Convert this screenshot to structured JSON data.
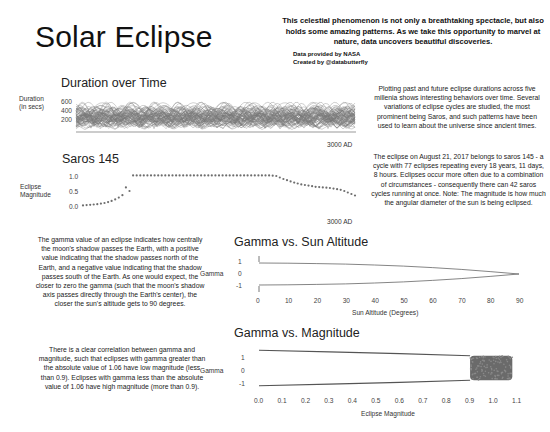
{
  "header": {
    "title": "Solar Eclipse",
    "intro": "This celestial phenomenon is not only a breathtaking spectacle, but also holds some amazing patterns. As we take this opportunity to marvel at nature, data uncovers beautiful discoveries.",
    "credit_data": "Data provided by NASA",
    "credit_creator": "Created by @databutterfly"
  },
  "sections": {
    "duration": {
      "title": "Duration over Time",
      "ylabel_line1": "Duration",
      "ylabel_line2": "(in secs)",
      "yticks": [
        "600",
        "400",
        "200"
      ],
      "end_label": "3000 AD",
      "description": "Plotting past and future eclipse durations across five millenia shows interesting behaviors over time. Several variations of eclipse cycles are studied, the most prominent being Saros, and such patterns have been used to learn about the universe since ancient times."
    },
    "saros": {
      "title": "Saros 145",
      "ylabel_line1": "Eclipse",
      "ylabel_line2": "Magnitude",
      "yticks": [
        "1.0",
        "0.5",
        "0.0"
      ],
      "end_label": "3000 AD",
      "description": "The eclipse on August 21, 2017 belongs to saros 145 - a cycle with 77 eclipses repeating every 18 years, 11 days, 8 hours. Eclipses occur more often due to a combination of circumstances - consequently there can 42 saros cycles running at once.  Note: The magnitude is how much the angular diameter of the sun is being eclipsed."
    },
    "gamma_altitude": {
      "title": "Gamma vs. Sun Altitude",
      "ylabel": "Gamma",
      "yticks": [
        "1",
        "0",
        "-1"
      ],
      "xticks": [
        "0",
        "10",
        "20",
        "30",
        "40",
        "50",
        "60",
        "70",
        "80",
        "90"
      ],
      "xlabel": "Sun Altitude (Degrees)",
      "description": "The gamma value of an eclipse indicates how centrally the moon's shadow passes the Earth, with a positive value indicating that the shadow passes north of the Earth, and a negative value indicating that the shadow passes south of the Earth. As one would expect, the closer to zero the gamma (such that the moon's shadow axis passes directly through the Earth's center), the closer the sun's altitude gets to 90 degrees."
    },
    "gamma_magnitude": {
      "title": "Gamma vs. Magnitude",
      "ylabel": "Gamma",
      "yticks": [
        "1",
        "0",
        "-1"
      ],
      "xticks": [
        "0.0",
        "0.1",
        "0.2",
        "0.3",
        "0.4",
        "0.5",
        "0.6",
        "0.7",
        "0.8",
        "0.9",
        "1.0",
        "1.1"
      ],
      "xlabel": "Eclipse Magnitude",
      "description": "There is a clear correlation between gamma and magnitude, such that eclipses with gamma greater than the absolute value of 1.06 have low magnitude (less than 0.9). Eclipses with gamma less than the absolute value of 1.06 have high magnitude (more than 0.9)."
    }
  },
  "colors": {
    "ink": "#111111",
    "series": "#777777",
    "dots": "#6e6e6e"
  },
  "chart_data": [
    {
      "type": "line",
      "title": "Duration over Time",
      "xlabel": "",
      "ylabel": "Duration (in secs)",
      "yticks": [
        200,
        400,
        600
      ],
      "ylim": [
        0,
        700
      ],
      "x_end_label": "3000 AD",
      "grid": false,
      "legend": "none",
      "note": "Many overlapping saros-cycle arcs spanning five millennia; durations mostly 0-450 s with peaks up to ~650 s."
    },
    {
      "type": "scatter",
      "title": "Saros 145",
      "ylabel": "Eclipse Magnitude",
      "yticks": [
        0.0,
        0.5,
        1.0
      ],
      "ylim": [
        0,
        1.1
      ],
      "x_end_label": "3000 AD",
      "series": [
        {
          "name": "Saros 145 eclipses",
          "count": 77,
          "values": [
            0.02,
            0.03,
            0.04,
            0.05,
            0.06,
            0.08,
            0.1,
            0.13,
            0.17,
            0.22,
            0.28,
            0.36,
            0.62,
            0.5,
            1.02,
            1.02,
            1.02,
            1.02,
            1.02,
            1.02,
            1.02,
            1.02,
            1.02,
            1.02,
            1.02,
            1.02,
            1.02,
            1.02,
            1.02,
            1.02,
            1.02,
            1.02,
            1.02,
            1.02,
            1.02,
            1.02,
            1.02,
            1.02,
            1.02,
            1.02,
            1.02,
            1.02,
            1.02,
            1.02,
            1.02,
            1.02,
            1.02,
            1.02,
            1.02,
            1.02,
            1.02,
            1.02,
            1.02,
            1.01,
            1.0,
            0.95,
            0.9,
            0.86,
            0.82,
            0.78,
            0.75,
            0.72,
            0.7,
            0.68,
            0.66,
            0.64,
            0.63,
            0.62,
            0.61,
            0.6,
            0.58,
            0.56,
            0.54,
            0.5,
            0.45,
            0.4,
            0.35
          ]
        }
      ]
    },
    {
      "type": "scatter",
      "title": "Gamma vs. Sun Altitude",
      "xlabel": "Sun Altitude (Degrees)",
      "ylabel": "Gamma",
      "xticks": [
        0,
        10,
        20,
        30,
        40,
        50,
        60,
        70,
        80,
        90
      ],
      "yticks": [
        -1,
        0,
        1
      ],
      "xlim": [
        0,
        90
      ],
      "ylim": [
        -1.6,
        1.6
      ],
      "series": [
        {
          "name": "upper branch",
          "x": [
            0,
            10,
            20,
            30,
            40,
            50,
            60,
            70,
            80,
            90
          ],
          "y": [
            1.0,
            0.98,
            0.95,
            0.9,
            0.82,
            0.72,
            0.58,
            0.42,
            0.22,
            0.0
          ]
        },
        {
          "name": "lower branch",
          "x": [
            0,
            10,
            20,
            30,
            40,
            50,
            60,
            70,
            80,
            90
          ],
          "y": [
            -1.0,
            -0.98,
            -0.95,
            -0.9,
            -0.82,
            -0.72,
            -0.58,
            -0.42,
            -0.22,
            0.0
          ]
        }
      ]
    },
    {
      "type": "scatter",
      "title": "Gamma vs. Magnitude",
      "xlabel": "Eclipse Magnitude",
      "ylabel": "Gamma",
      "xticks": [
        0.0,
        0.1,
        0.2,
        0.3,
        0.4,
        0.5,
        0.6,
        0.7,
        0.8,
        0.9,
        1.0,
        1.1
      ],
      "yticks": [
        -1,
        0,
        1
      ],
      "xlim": [
        0,
        1.1
      ],
      "ylim": [
        -1.6,
        1.6
      ],
      "series": [
        {
          "name": "partial (upper)",
          "x": [
            0.0,
            0.3,
            0.6,
            0.9
          ],
          "y": [
            1.55,
            1.4,
            1.25,
            1.06
          ]
        },
        {
          "name": "partial (lower)",
          "x": [
            0.0,
            0.3,
            0.6,
            0.9
          ],
          "y": [
            -1.55,
            -1.4,
            -1.25,
            -1.06
          ]
        },
        {
          "name": "central cluster",
          "x_range": [
            0.9,
            1.08
          ],
          "y_range": [
            -1.06,
            1.06
          ]
        }
      ]
    }
  ]
}
